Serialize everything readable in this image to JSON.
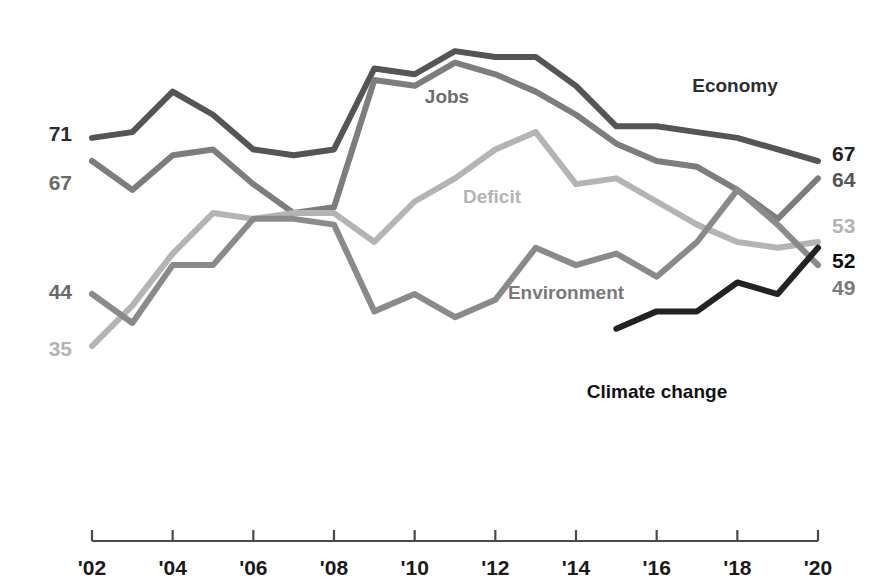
{
  "chart_data": {
    "type": "line",
    "title": "",
    "subtitle": "",
    "xlabel": "",
    "ylabel": "",
    "grid": false,
    "legend_position": "inline-labels",
    "x": [
      2002,
      2003,
      2004,
      2005,
      2006,
      2007,
      2008,
      2009,
      2010,
      2011,
      2012,
      2013,
      2014,
      2015,
      2016,
      2017,
      2018,
      2019,
      2020
    ],
    "xlim": [
      2002,
      2020
    ],
    "ylim": [
      30,
      90
    ],
    "tick_labels": [
      "'02",
      "'04",
      "'06",
      "'08",
      "'10",
      "'12",
      "'14",
      "'16",
      "'18",
      "'20"
    ],
    "tick_values": [
      2002,
      2004,
      2006,
      2008,
      2010,
      2012,
      2014,
      2016,
      2018,
      2020
    ],
    "series": [
      {
        "name": "Economy",
        "color": "#555555",
        "label_color": "#3a3a3a",
        "start_value": 71,
        "end_value": 67,
        "values": [
          71,
          72,
          79,
          75,
          69,
          68,
          69,
          83,
          82,
          86,
          85,
          85,
          80,
          73,
          73,
          72,
          71,
          69,
          67
        ]
      },
      {
        "name": "Jobs",
        "color": "#7d7d7d",
        "label_color": "#6e6e6e",
        "start_value": 67,
        "end_value": 64,
        "values": [
          67,
          62,
          68,
          69,
          63,
          58,
          59,
          81,
          80,
          84,
          82,
          79,
          75,
          70,
          67,
          66,
          62,
          57,
          64
        ]
      },
      {
        "name": "Deficit",
        "color": "#b4b4b4",
        "label_color": "#b4b4b4",
        "start_value": 35,
        "end_value": 53,
        "values": [
          35,
          42,
          51,
          58,
          57,
          58,
          58,
          53,
          60,
          64,
          69,
          72,
          63,
          64,
          60,
          56,
          53,
          52,
          53
        ]
      },
      {
        "name": "Environment",
        "color": "#8a8a8a",
        "label_color": "#7a7a7a",
        "start_value": 44,
        "end_value": 49,
        "values": [
          44,
          39,
          49,
          49,
          57,
          57,
          56,
          41,
          44,
          40,
          43,
          52,
          49,
          51,
          47,
          53,
          62,
          56,
          49
        ]
      },
      {
        "name": "Climate change",
        "color": "#222222",
        "label_color": "#111111",
        "start_value": 38,
        "end_value": 52,
        "start_year": 2015,
        "values": [
          null,
          null,
          null,
          null,
          null,
          null,
          null,
          null,
          null,
          null,
          null,
          null,
          null,
          38,
          41,
          41,
          46,
          44,
          52
        ]
      }
    ],
    "inline_labels": [
      {
        "text": "Economy",
        "x": 735,
        "y": 92,
        "color": "#2e2e2e",
        "anchor": "middle"
      },
      {
        "text": "Jobs",
        "x": 447,
        "y": 103,
        "color": "#6e6e6e",
        "anchor": "middle"
      },
      {
        "text": "Deficit",
        "x": 492,
        "y": 203,
        "color": "#b4b4b4",
        "anchor": "middle"
      },
      {
        "text": "Environment",
        "x": 566,
        "y": 299,
        "color": "#7a7a7a",
        "anchor": "middle"
      },
      {
        "text": "Climate change",
        "x": 657,
        "y": 398,
        "color": "#111111",
        "anchor": "middle"
      }
    ],
    "left_value_labels": [
      {
        "text": "71",
        "y": 141,
        "color": "#2e2e2e"
      },
      {
        "text": "67",
        "y": 190,
        "color": "#6a6a6a"
      },
      {
        "text": "44",
        "y": 299,
        "color": "#6a6a6a"
      },
      {
        "text": "35",
        "y": 356,
        "color": "#b4b4b4"
      }
    ],
    "right_value_labels": [
      {
        "text": "67",
        "y": 161,
        "color": "#1f1f1f"
      },
      {
        "text": "64",
        "y": 187,
        "color": "#555555"
      },
      {
        "text": "53",
        "y": 233,
        "color": "#b4b4b4"
      },
      {
        "text": "52",
        "y": 268,
        "color": "#0d0d0d"
      },
      {
        "text": "49",
        "y": 295,
        "color": "#7a7a7a"
      }
    ]
  }
}
